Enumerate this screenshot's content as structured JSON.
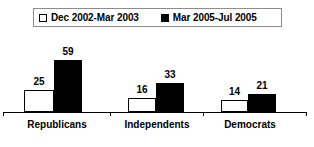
{
  "chart_data": {
    "type": "bar",
    "title": "",
    "subtitle": "",
    "xlabel": "",
    "ylabel": "",
    "grid": false,
    "legend_position": "top",
    "categories": [
      "Republicans",
      "Independents",
      "Democrats"
    ],
    "series": [
      {
        "name": "Dec 2002-Mar 2003",
        "swatch": "white-square-icon",
        "color": "#ffffff",
        "border_color": "#000000",
        "values": [
          25,
          16,
          14
        ]
      },
      {
        "name": "Mar 2005-Jul 2005",
        "swatch": "black-square-icon",
        "color": "#000000",
        "border_color": "#000000",
        "values": [
          59,
          33,
          21
        ]
      }
    ],
    "ylim": [
      0,
      70
    ],
    "value_labels": [
      [
        "25",
        "59"
      ],
      [
        "16",
        "33"
      ],
      [
        "14",
        "21"
      ]
    ]
  },
  "legend": {
    "entries": [
      {
        "label": "Dec 2002-Mar 2003"
      },
      {
        "label": "Mar 2005-Jul 2005"
      }
    ]
  },
  "axis": {
    "categories": [
      {
        "label": "Republicans"
      },
      {
        "label": "Independents"
      },
      {
        "label": "Democrats"
      }
    ]
  }
}
